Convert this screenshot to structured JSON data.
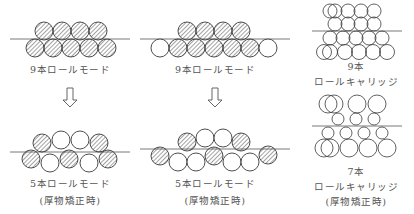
{
  "colors": {
    "stroke": "#3a3a3a",
    "hatch": "#555555",
    "line": "#555555",
    "text": "#555555"
  },
  "panels": [
    {
      "id": "nine-roll-mode-a",
      "label": "9本ロールモード"
    },
    {
      "id": "nine-roll-mode-b",
      "label": "9本ロールモード"
    },
    {
      "id": "five-roll-mode-a",
      "label": "5本ロールモード",
      "sublabel": "(厚物矯正時)"
    },
    {
      "id": "five-roll-mode-b",
      "label": "5本ロールモード",
      "sublabel": "(厚物矯正時)"
    },
    {
      "id": "nine-roll-carriage",
      "label": "9本",
      "label2": "ロールキャリッジ"
    },
    {
      "id": "seven-roll-carriage",
      "label": "7本",
      "label2": "ロールキャリッジ",
      "sublabel": "(厚物矯正時)"
    }
  ],
  "arrows": [
    {
      "icon": "down-arrow-icon"
    },
    {
      "icon": "down-arrow-icon"
    }
  ]
}
